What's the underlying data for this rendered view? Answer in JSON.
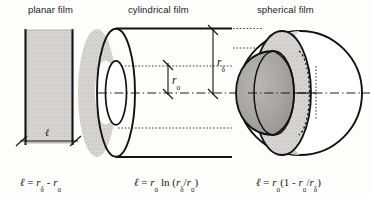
{
  "figure": {
    "caption_kind": "diagram",
    "background_color": "#fdfdfc",
    "ink_color": "#101114",
    "panels": [
      {
        "id": "planar",
        "title": "planar film",
        "shape": "rectangle",
        "fill_color": "#d6d4d1",
        "dimension_labels": [
          "ℓ"
        ],
        "formula": "ℓ = rδ - rₒ"
      },
      {
        "id": "cylindrical",
        "title": "cylindrical film",
        "shape": "annular-cylinder",
        "fill_color": "#d3d1ce",
        "dimension_labels": [
          "rₒ",
          "rδ"
        ],
        "formula": "ℓ = rₒ ln (rδ/rₒ)"
      },
      {
        "id": "spherical",
        "title": "spherical film",
        "shape": "cutaway-sphere",
        "shell_fill_color": "#d5d3d0",
        "core_fill_color": "#a9a7a5",
        "dimension_labels": [],
        "formula": "ℓ = rₒ(1 - rₒ/rδ)"
      }
    ]
  },
  "titles": {
    "planar": "planar film",
    "cylindrical": "cylindrical film",
    "spherical": "spherical film"
  },
  "symbols": {
    "ell": "ℓ",
    "equals": "=",
    "minus": "-",
    "r": "r",
    "sub_o": "o",
    "sub_delta": "δ",
    "ln": "ln",
    "one": "1",
    "slash": "/",
    "paren_open": "(",
    "paren_close": ")"
  },
  "dimensions": {
    "cyl_inner_radius_label_r": "r",
    "cyl_inner_radius_label_sub": "o",
    "cyl_outer_radius_label_r": "r",
    "cyl_outer_radius_label_sub": "δ",
    "planar_thickness_label": "ℓ"
  }
}
